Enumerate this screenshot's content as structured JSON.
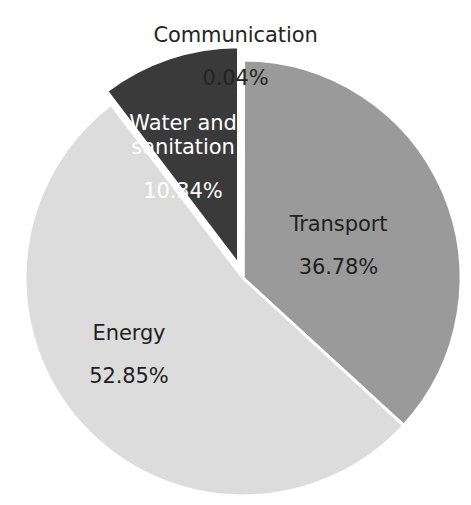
{
  "chart_data": {
    "type": "pie",
    "title": "",
    "subtitle": "",
    "xlabel": "",
    "ylabel": "",
    "legend_position": "none",
    "grid": false,
    "labels_on_slices": true,
    "units": "percent",
    "total": 100.01,
    "categories": [
      "Communication",
      "Transport",
      "Energy",
      "Water and sanitation"
    ],
    "values": [
      0.04,
      36.78,
      52.85,
      10.34
    ],
    "value_labels": [
      "0.04%",
      "36.78%",
      "52.85%",
      "10.34%"
    ],
    "start_angle_deg": 0,
    "direction": "clockwise",
    "slices": [
      {
        "name": "Communication",
        "value": 0.04,
        "value_label": "0.04%",
        "color": "#ffffff",
        "label_color": "#242424",
        "label_placement": "outside-top",
        "exploded": false
      },
      {
        "name": "Transport",
        "value": 36.78,
        "value_label": "36.78%",
        "color": "#9a9a9a",
        "label_color": "#1f1f1f",
        "label_placement": "inside",
        "exploded": false
      },
      {
        "name": "Energy",
        "value": 52.85,
        "value_label": "52.85%",
        "color": "#dcdcdc",
        "label_color": "#1f1f1f",
        "label_placement": "inside",
        "exploded": false
      },
      {
        "name": "Water and sanitation",
        "value": 10.34,
        "value_label": "10.34%",
        "color": "#3a3a3a",
        "label_color": "#ffffff",
        "label_placement": "inside",
        "exploded": true
      }
    ],
    "background_color": "#ffffff",
    "slice_border_color": "#ffffff"
  },
  "labels": {
    "communication": {
      "name": "Communication",
      "value": "0.04%"
    },
    "transport": {
      "name": "Transport",
      "value": "36.78%"
    },
    "energy": {
      "name": "Energy",
      "value": "52.85%"
    },
    "water": {
      "name": "Water and\nsanitation",
      "value": "10.34%"
    }
  }
}
